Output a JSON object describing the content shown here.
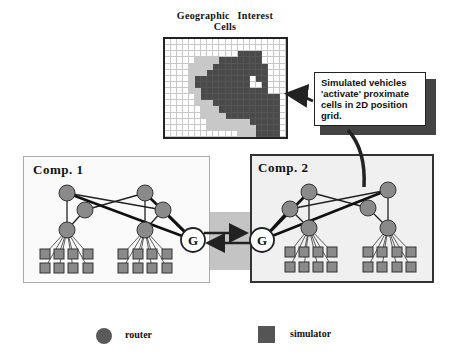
{
  "grid": {
    "title": "Geographic  Interest  Cells",
    "cols": 20,
    "rows": 16,
    "cells": [
      "00000000000000000000",
      "00000000000000000000",
      "00000000000022220000",
      "00000111122222220000",
      "00001111222222222000",
      "00001112222222222000",
      "00001222222222022000",
      "00001222222222002000",
      "00001122222222222000",
      "00000122222222222220",
      "00000111222222222220",
      "00000011122222222220",
      "00000011112222222220",
      "00000001111111222220",
      "00000001111111122220",
      "00000000000011122220"
    ]
  },
  "callout": {
    "lines": [
      "Simulated vehicles",
      "'activate' proximate",
      "cells in 2D position",
      "grid."
    ]
  },
  "components": [
    {
      "label": "Comp. 1"
    },
    {
      "label": "Comp. 2"
    }
  ],
  "gateway_label": "G",
  "legend": {
    "router_label": "router",
    "simulator_label": "simulator"
  },
  "colors": {
    "node_fill": "#8a8a8a",
    "node_stroke": "#333333",
    "cell_dark": "#4a4a4a",
    "cell_light": "#c8c8c8"
  }
}
